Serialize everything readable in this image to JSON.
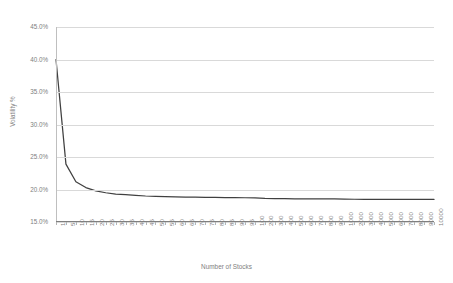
{
  "chart_data": {
    "type": "line",
    "title": "",
    "xlabel": "Number of Stocks",
    "ylabel": "Volatility %",
    "grid": true,
    "legend": false,
    "ylim": [
      15.0,
      45.0
    ],
    "ytick_labels": [
      "45.0%",
      "40.0%",
      "35.0%",
      "30.0%",
      "25.0%",
      "20.0%",
      "15.0%"
    ],
    "ytick_values": [
      45.0,
      40.0,
      35.0,
      30.0,
      25.0,
      20.0,
      15.0
    ],
    "categories": [
      "1",
      "5",
      "10",
      "15",
      "20",
      "25",
      "30",
      "35",
      "40",
      "45",
      "50",
      "55",
      "60",
      "65",
      "70",
      "75",
      "80",
      "85",
      "90",
      "95",
      "100",
      "200",
      "300",
      "400",
      "500",
      "600",
      "700",
      "800",
      "900",
      "1000",
      "2000",
      "3000",
      "4000",
      "5000",
      "6000",
      "7000",
      "8000",
      "9000",
      "10000"
    ],
    "series": [
      {
        "name": "Portfolio Volatility",
        "color": "#404040",
        "values": [
          40.0,
          23.9,
          21.2,
          20.3,
          19.8,
          19.5,
          19.3,
          19.2,
          19.1,
          19.0,
          18.95,
          18.9,
          18.87,
          18.84,
          18.82,
          18.8,
          18.78,
          18.76,
          18.75,
          18.73,
          18.72,
          18.63,
          18.6,
          18.58,
          18.57,
          18.56,
          18.55,
          18.54,
          18.54,
          18.53,
          18.5,
          18.49,
          18.49,
          18.48,
          18.48,
          18.48,
          18.47,
          18.47,
          18.47
        ]
      }
    ]
  },
  "axes": {
    "y_title": "Volatility %",
    "x_title": "Number of Stocks"
  }
}
